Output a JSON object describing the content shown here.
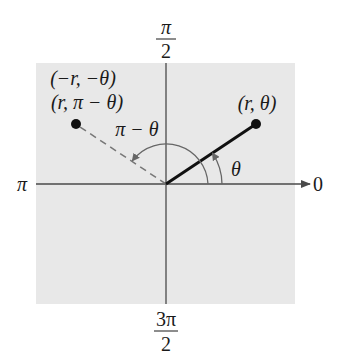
{
  "diagram": {
    "type": "polar-coordinate-diagram",
    "colors": {
      "background": "#ffffff",
      "plane": "#e8e8e8",
      "axis": "#4a4a4a",
      "ray": "#111111",
      "dashed": "#777777",
      "arc": "#666666",
      "point": "#111111"
    },
    "axis_labels": {
      "top_num": "π",
      "top_den": "2",
      "left": "π",
      "right": "0",
      "bottom_num": "3π",
      "bottom_den": "2"
    },
    "points": {
      "primary": {
        "label": "(r, θ)"
      },
      "reflected": {
        "label_line1": "(−r, −θ)",
        "label_line2": "(r, π − θ)"
      }
    },
    "angles": {
      "theta": "θ",
      "pi_minus_theta": "π − θ"
    }
  }
}
